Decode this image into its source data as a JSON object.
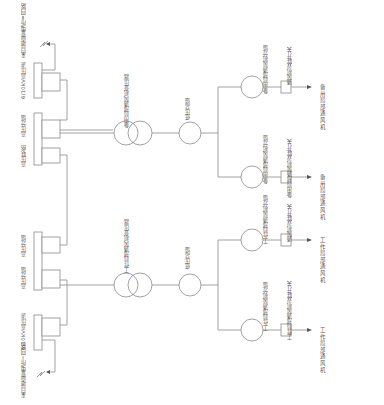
{
  "diagram": {
    "type": "electrical single-line diagram (rotated 90°)",
    "upper_branch": {
      "source_label": "来自地面变电所Ⅱ回路",
      "incoming_box_label": "6/10kV高压进",
      "hv_switch_label": "高压分馈",
      "hv_tie_label": "高压联络",
      "transformer_label": "备用局部通风机变压器",
      "lv_feeder_label": "低压总馈",
      "fans": [
        {
          "feeder_label": "备用局部通风机分馈",
          "switch_label": "通风机双联开关",
          "fan_label": "备用局部通风机"
        },
        {
          "feeder_label": "备用局部通风机分馈",
          "switch_label": "备用局部通风机双联开关",
          "fan_label": "备用局部通风机"
        }
      ]
    },
    "lower_branch": {
      "source_label": "来自地面变电所Ⅰ回路",
      "incoming_box_label": "6/10kV高压进",
      "hv_switch_label": "高压分馈",
      "hv_switch2_label": "高压分馈",
      "transformer_label": "工作局部通风机变压器",
      "lv_feeder_label": "低压总馈",
      "fans": [
        {
          "feeder_label": "工作局部通风机分馈",
          "switch_label": "通风机双联开关",
          "fan_label": "工作局部通风机"
        },
        {
          "feeder_label": "工作局部通风机分馈",
          "switch_label": "工作局部通风机双联开关",
          "fan_label": "工作局部通风机"
        }
      ]
    }
  }
}
